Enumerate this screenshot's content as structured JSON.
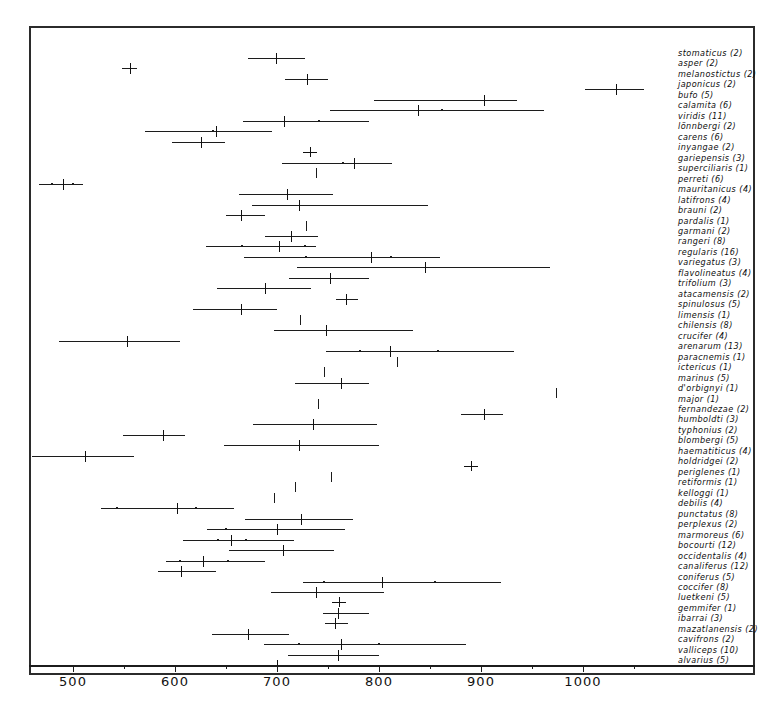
{
  "chart_data": {
    "type": "scatter",
    "title": "",
    "subtitle": "",
    "xlabel": "",
    "ylabel": "",
    "xlim": [
      455,
      1090
    ],
    "xticks_major": [
      500,
      600,
      700,
      800,
      900,
      1000
    ],
    "xticks_minor": [
      550,
      650,
      750,
      850,
      950,
      1050
    ],
    "grid": false,
    "legend": null,
    "orientation": "horizontal",
    "series_description": "range-with-mean-and-sd",
    "rows": [
      {
        "label": "stomaticus (2)",
        "n": 2,
        "min": 672,
        "max": 727,
        "mean": 699,
        "sd_low": null,
        "sd_high": null
      },
      {
        "label": "asper (2)",
        "n": 2,
        "min": 548,
        "max": 563,
        "mean": 556,
        "sd_low": null,
        "sd_high": null
      },
      {
        "label": "melanostictus (2)",
        "n": 2,
        "min": 708,
        "max": 750,
        "mean": 729,
        "sd_low": null,
        "sd_high": null
      },
      {
        "label": "japonicus (2)",
        "n": 2,
        "min": 1002,
        "max": 1060,
        "mean": 1032,
        "sd_low": null,
        "sd_high": null
      },
      {
        "label": "bufo (5)",
        "n": 5,
        "min": 795,
        "max": 935,
        "mean": 903,
        "sd_low": null,
        "sd_high": null
      },
      {
        "label": "calamita (6)",
        "n": 6,
        "min": 752,
        "max": 962,
        "mean": 838,
        "sd_low": 862,
        "sd_high": 862
      },
      {
        "label": "viridis (11)",
        "n": 11,
        "min": 667,
        "max": 790,
        "mean": 707,
        "sd_low": 741,
        "sd_high": 741
      },
      {
        "label": "lönnbergi (2)",
        "n": 2,
        "min": 571,
        "max": 695,
        "mean": 640,
        "sd_low": 637,
        "sd_high": 637
      },
      {
        "label": "carens (6)",
        "n": 6,
        "min": 597,
        "max": 649,
        "mean": 625,
        "sd_low": null,
        "sd_high": null
      },
      {
        "label": "inyangae (2)",
        "n": 2,
        "min": 732,
        "max": 732,
        "mean": 732,
        "sd_low": null,
        "sd_high": null
      },
      {
        "label": "gariepensis (3)",
        "n": 3,
        "min": 705,
        "max": 813,
        "mean": 775,
        "sd_low": 765,
        "sd_high": 765
      },
      {
        "label": "superciliaris (1)",
        "n": 1,
        "min": 738,
        "max": 738,
        "mean": 738,
        "sd_low": null,
        "sd_high": null
      },
      {
        "label": "perreti (6)",
        "n": 6,
        "min": 467,
        "max": 510,
        "mean": 490,
        "sd_low": 479,
        "sd_high": 500
      },
      {
        "label": "mauritanicus (4)",
        "n": 4,
        "min": 663,
        "max": 755,
        "mean": 710,
        "sd_low": null,
        "sd_high": null
      },
      {
        "label": "latifrons (4)",
        "n": 4,
        "min": 675,
        "max": 848,
        "mean": 722,
        "sd_low": null,
        "sd_high": null
      },
      {
        "label": "brauni (2)",
        "n": 2,
        "min": 650,
        "max": 688,
        "mean": 665,
        "sd_low": null,
        "sd_high": null
      },
      {
        "label": "pardalis (1)",
        "n": 1,
        "min": 728,
        "max": 728,
        "mean": 728,
        "sd_low": null,
        "sd_high": null
      },
      {
        "label": "garmani (2)",
        "n": 2,
        "min": 688,
        "max": 740,
        "mean": 714,
        "sd_low": null,
        "sd_high": null
      },
      {
        "label": "rangeri (8)",
        "n": 8,
        "min": 630,
        "max": 738,
        "mean": 702,
        "sd_low": 666,
        "sd_high": 727
      },
      {
        "label": "regularis (16)",
        "n": 16,
        "min": 668,
        "max": 860,
        "mean": 792,
        "sd_low": 728,
        "sd_high": 812
      },
      {
        "label": "variegatus (3)",
        "n": 3,
        "min": 720,
        "max": 968,
        "mean": 845,
        "sd_low": null,
        "sd_high": null
      },
      {
        "label": "flavolineatus (4)",
        "n": 4,
        "min": 712,
        "max": 790,
        "mean": 752,
        "sd_low": null,
        "sd_high": null
      },
      {
        "label": "trifolium (3)",
        "n": 3,
        "min": 641,
        "max": 733,
        "mean": 688,
        "sd_low": null,
        "sd_high": null
      },
      {
        "label": "atacamensis (2)",
        "n": 2,
        "min": 758,
        "max": 779,
        "mean": 768,
        "sd_low": null,
        "sd_high": null
      },
      {
        "label": "spinulosus (5)",
        "n": 5,
        "min": 618,
        "max": 700,
        "mean": 665,
        "sd_low": null,
        "sd_high": null
      },
      {
        "label": "limensis (1)",
        "n": 1,
        "min": 723,
        "max": 723,
        "mean": 723,
        "sd_low": null,
        "sd_high": null
      },
      {
        "label": "chilensis (8)",
        "n": 8,
        "min": 697,
        "max": 833,
        "mean": 748,
        "sd_low": null,
        "sd_high": null
      },
      {
        "label": "crucifer (4)",
        "n": 4,
        "min": 486,
        "max": 605,
        "mean": 553,
        "sd_low": null,
        "sd_high": null
      },
      {
        "label": "arenarum (13)",
        "n": 13,
        "min": 748,
        "max": 932,
        "mean": 811,
        "sd_low": 781,
        "sd_high": 858
      },
      {
        "label": "paracnemis (1)",
        "n": 1,
        "min": 818,
        "max": 818,
        "mean": 818,
        "sd_low": null,
        "sd_high": null
      },
      {
        "label": "ictericus (1)",
        "n": 1,
        "min": 746,
        "max": 746,
        "mean": 746,
        "sd_low": null,
        "sd_high": null
      },
      {
        "label": "marinus (5)",
        "n": 5,
        "min": 718,
        "max": 790,
        "mean": 763,
        "sd_low": null,
        "sd_high": null
      },
      {
        "label": "d'orbignyi (1)",
        "n": 1,
        "min": 974,
        "max": 974,
        "mean": 974,
        "sd_low": null,
        "sd_high": null
      },
      {
        "label": "major (1)",
        "n": 1,
        "min": 740,
        "max": 740,
        "mean": 740,
        "sd_low": null,
        "sd_high": null
      },
      {
        "label": "fernandezae (2)",
        "n": 2,
        "min": 880,
        "max": 922,
        "mean": 903,
        "sd_low": null,
        "sd_high": null
      },
      {
        "label": "humboldti (3)",
        "n": 3,
        "min": 676,
        "max": 798,
        "mean": 735,
        "sd_low": null,
        "sd_high": null
      },
      {
        "label": "typhonius (2)",
        "n": 2,
        "min": 549,
        "max": 610,
        "mean": 588,
        "sd_low": null,
        "sd_high": null
      },
      {
        "label": "blombergi (5)",
        "n": 5,
        "min": 648,
        "max": 800,
        "mean": 722,
        "sd_low": null,
        "sd_high": null
      },
      {
        "label": "haematiticus (4)",
        "n": 4,
        "min": 460,
        "max": 560,
        "mean": 512,
        "sd_low": null,
        "sd_high": null
      },
      {
        "label": "holdridgei (2)",
        "n": 2,
        "min": 890,
        "max": 890,
        "mean": 890,
        "sd_low": null,
        "sd_high": null
      },
      {
        "label": "periglenes (1)",
        "n": 1,
        "min": 753,
        "max": 753,
        "mean": 753,
        "sd_low": null,
        "sd_high": null
      },
      {
        "label": "retiformis (1)",
        "n": 1,
        "min": 718,
        "max": 718,
        "mean": 718,
        "sd_low": null,
        "sd_high": null
      },
      {
        "label": "kelloggi (1)",
        "n": 1,
        "min": 697,
        "max": 697,
        "mean": 697,
        "sd_low": null,
        "sd_high": null
      },
      {
        "label": "debilis (4)",
        "n": 4,
        "min": 527,
        "max": 658,
        "mean": 602,
        "sd_low": 543,
        "sd_high": 621
      },
      {
        "label": "punctatus (8)",
        "n": 8,
        "min": 669,
        "max": 775,
        "mean": 724,
        "sd_low": null,
        "sd_high": null
      },
      {
        "label": "perplexus (2)",
        "n": 2,
        "min": 631,
        "max": 767,
        "mean": 700,
        "sd_low": 650,
        "sd_high": 650
      },
      {
        "label": "marmoreus (6)",
        "n": 6,
        "min": 608,
        "max": 717,
        "mean": 655,
        "sd_low": 642,
        "sd_high": 670
      },
      {
        "label": "bocourti (12)",
        "n": 12,
        "min": 653,
        "max": 756,
        "mean": 706,
        "sd_low": null,
        "sd_high": null
      },
      {
        "label": "occidentalis (4)",
        "n": 4,
        "min": 591,
        "max": 688,
        "mean": 627,
        "sd_low": 605,
        "sd_high": 652
      },
      {
        "label": "canaliferus (12)",
        "n": 12,
        "min": 583,
        "max": 640,
        "mean": 606,
        "sd_low": null,
        "sd_high": null
      },
      {
        "label": "coniferus (5)",
        "n": 5,
        "min": 725,
        "max": 920,
        "mean": 803,
        "sd_low": 746,
        "sd_high": 855
      },
      {
        "label": "coccifer (8)",
        "n": 8,
        "min": 694,
        "max": 805,
        "mean": 738,
        "sd_low": null,
        "sd_high": null
      },
      {
        "label": "luetkeni (5)",
        "n": 5,
        "min": 761,
        "max": 761,
        "mean": 761,
        "sd_low": null,
        "sd_high": null
      },
      {
        "label": "gemmifer (1)",
        "n": 1,
        "min": 745,
        "max": 790,
        "mean": 760,
        "sd_low": null,
        "sd_high": null
      },
      {
        "label": "ibarrai (3)",
        "n": 3,
        "min": 747,
        "max": 770,
        "mean": 757,
        "sd_low": null,
        "sd_high": null
      },
      {
        "label": "mazatlanensis (2)",
        "n": 2,
        "min": 636,
        "max": 712,
        "mean": 672,
        "sd_low": null,
        "sd_high": null
      },
      {
        "label": "cavifrons (2)",
        "n": 2,
        "min": 687,
        "max": 885,
        "mean": 763,
        "sd_low": 722,
        "sd_high": 800
      },
      {
        "label": "valliceps (10)",
        "n": 10,
        "min": 711,
        "max": 800,
        "mean": 760,
        "sd_low": null,
        "sd_high": null
      },
      {
        "label": "alvarius (5)",
        "n": 5,
        "min": 700,
        "max": 700,
        "mean": 700,
        "sd_low": null,
        "sd_high": null
      }
    ],
    "labels": [
      "stomaticus (2)",
      "asper (2)",
      "melanostictus (2)",
      "japonicus (2)",
      "bufo (5)",
      "calamita (6)",
      "viridis (11)",
      "lönnbergi (2)",
      "carens (6)",
      "inyangae (2)",
      "gariepensis (3)",
      "superciliaris (1)",
      "perreti (6)",
      "mauritanicus (4)",
      "latifrons (4)",
      "brauni (2)",
      "pardalis (1)",
      "garmani (2)",
      "rangeri (8)",
      "regularis (16)",
      "variegatus (3)",
      "flavolineatus (4)",
      "trifolium (3)",
      "atacamensis (2)",
      "spinulosus (5)",
      "limensis (1)",
      "chilensis (8)",
      "crucifer (4)",
      "arenarum (13)",
      "paracnemis (1)",
      "ictericus (1)",
      "marinus (5)",
      "d'orbignyi (1)",
      "major (1)",
      "fernandezae (2)",
      "humboldti (3)",
      "typhonius (2)",
      "blombergi (5)",
      "haematiticus (4)",
      "holdridgei (2)",
      "periglenes (1)",
      "retiformis (1)",
      "kelloggi (1)",
      "debilis (4)",
      "punctatus (8)",
      "perplexus (2)",
      "marmoreus (6)",
      "bocourti (12)",
      "occidentalis (4)",
      "canaliferus (12)",
      "coniferus (5)",
      "coccifer (8)",
      "luetkeni (5)",
      "gemmifer (1)",
      "ibarrai (3)",
      "mazatlanensis (2)",
      "cavifrons (2)",
      "valliceps (10)",
      "alvarius (5)"
    ],
    "colors": {
      "line": "#1c1c1c",
      "frame": "#2b2b2b",
      "text": "#0d0d0d",
      "background": "#ffffff"
    }
  },
  "axis": {
    "tick_labels": [
      "500",
      "600",
      "700",
      "800",
      "900",
      "1000"
    ]
  }
}
